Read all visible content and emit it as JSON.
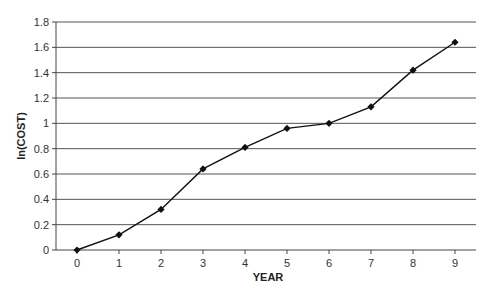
{
  "chart_data": {
    "type": "line",
    "title": "",
    "xlabel": "YEAR",
    "ylabel": "ln(COST)",
    "x": [
      0,
      1,
      2,
      3,
      4,
      5,
      6,
      7,
      8,
      9
    ],
    "series": [
      {
        "name": "ln(COST)",
        "values": [
          0,
          0.12,
          0.32,
          0.64,
          0.81,
          0.96,
          1.0,
          1.13,
          1.42,
          1.64
        ],
        "marker": "diamond",
        "color": "#111111"
      }
    ],
    "xticks": [
      "0",
      "1",
      "2",
      "3",
      "4",
      "5",
      "6",
      "7",
      "8",
      "9"
    ],
    "yticks": [
      "0",
      "0.2",
      "0.4",
      "0.6",
      "0.8",
      "1",
      "1.2",
      "1.4",
      "1.6",
      "1.8"
    ],
    "ylim": [
      0,
      1.8
    ],
    "xlim": [
      -0.5,
      9.5
    ],
    "grid": {
      "horizontal": true,
      "vertical": false,
      "color": "#555555"
    },
    "legend": null
  }
}
